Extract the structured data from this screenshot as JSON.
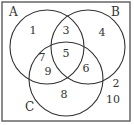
{
  "diagram": {
    "type": "venn",
    "sets": [
      {
        "label": "A",
        "cx": 47,
        "cy": 47,
        "r": 37,
        "label_x": 9,
        "label_y": 16
      },
      {
        "label": "B",
        "cx": 88,
        "cy": 47,
        "r": 37,
        "label_x": 111,
        "label_y": 16
      },
      {
        "label": "C",
        "cx": 66,
        "cy": 79,
        "r": 37,
        "label_x": 25,
        "label_y": 111
      }
    ],
    "regions": [
      {
        "region": "A only",
        "value": "1",
        "x": 33,
        "y": 34
      },
      {
        "region": "A and B only",
        "value": "3",
        "x": 66,
        "y": 34
      },
      {
        "region": "B only",
        "value": "4",
        "x": 102,
        "y": 36
      },
      {
        "region": "A and C only (upper)",
        "value": "7",
        "x": 42,
        "y": 61
      },
      {
        "region": "A and B and C",
        "value": "5",
        "x": 66,
        "y": 57
      },
      {
        "region": "B and C only",
        "value": "6",
        "x": 86,
        "y": 72
      },
      {
        "region": "A and C only (lower)",
        "value": "9",
        "x": 48,
        "y": 75
      },
      {
        "region": "C only",
        "value": "8",
        "x": 64,
        "y": 98
      },
      {
        "region": "outside (upper)",
        "value": "2",
        "x": 116,
        "y": 87
      },
      {
        "region": "outside (lower)",
        "value": "10",
        "x": 113,
        "y": 103
      }
    ],
    "colors": {
      "stroke": "#333333",
      "border": "#555555",
      "background": "#ffffff"
    }
  }
}
